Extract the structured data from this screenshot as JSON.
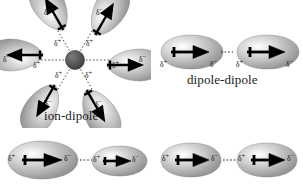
{
  "figure": {
    "background_color": "#ffffff",
    "cloud_color_dark": "#8a8a8a",
    "cloud_color_light": "#d8d8d8",
    "arrow_color": "#000000",
    "dash_color": "#222222",
    "ion_color": "#4a4a4a"
  },
  "symbols": {
    "delta_positive": "δ",
    "delta_positive_sign": "+",
    "delta_negative": "δ",
    "delta_negative_sign": "−"
  },
  "panels": [
    {
      "id": "ion-dipole",
      "caption": "ion-dipole",
      "description": "A central ion surrounded by six dipolar molecules oriented with their partial positive ends toward the ion",
      "ion": {
        "label": "",
        "charge": "−",
        "count": 1
      },
      "molecule_count": 6,
      "lobe_angles_deg": [
        180,
        240,
        300,
        0,
        60,
        120
      ],
      "charge_labels": [
        "δ−",
        "δ+"
      ]
    },
    {
      "id": "dipole-dipole",
      "caption": "dipole-dipole",
      "description": "Two identical polar molecules aligned positive end to negative end",
      "molecule_count": 2,
      "charge_labels": [
        "δ+",
        "δ−"
      ]
    },
    {
      "id": "dipole-induced-dipole",
      "caption": "",
      "description": "A large polar molecule next to a smaller molecule in which a dipole is induced",
      "molecule_count": 2,
      "charge_labels": [
        "δ+",
        "δ−"
      ]
    },
    {
      "id": "dispersion",
      "caption": "",
      "description": "Two nonpolar molecules with instantaneous dipoles",
      "molecule_count": 2,
      "charge_labels": [
        "δ+",
        "δ−"
      ]
    }
  ]
}
